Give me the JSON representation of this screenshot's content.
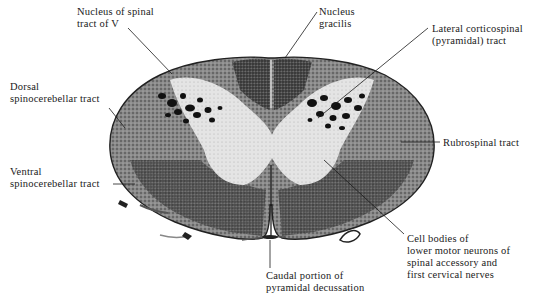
{
  "diagram": {
    "colors": {
      "background": "#ffffff",
      "gray_matter_dark": "#2b2b2b",
      "white_matter_stipple": "#6e6e6e",
      "pale_region": "#e8e8e8",
      "leader_line": "#1a1a1a",
      "label_text": "#1a1a1a"
    }
  },
  "labels": {
    "nucleus_spinal_tract_v": {
      "line1": "Nucleus of spinal",
      "line2": "tract of V"
    },
    "nucleus_gracilis": {
      "line1": "Nucleus",
      "line2": "gracilis"
    },
    "lateral_corticospinal": {
      "line1": "Lateral corticospinal",
      "line2": "(pyramidal) tract"
    },
    "dorsal_spinocerebellar": {
      "line1": "Dorsal",
      "line2": "spinocerebellar tract"
    },
    "rubrospinal": {
      "line1": "Rubrospinal tract"
    },
    "ventral_spinocerebellar": {
      "line1": "Ventral",
      "line2": "spinocerebellar tract"
    },
    "cell_bodies": {
      "line1": "Cell bodies of",
      "line2": "lower motor neurons of",
      "line3": "spinal accessory and",
      "line4": "first cervical nerves"
    },
    "caudal_pyramidal": {
      "line1": "Caudal portion of",
      "line2": "pyramidal decussation"
    }
  }
}
